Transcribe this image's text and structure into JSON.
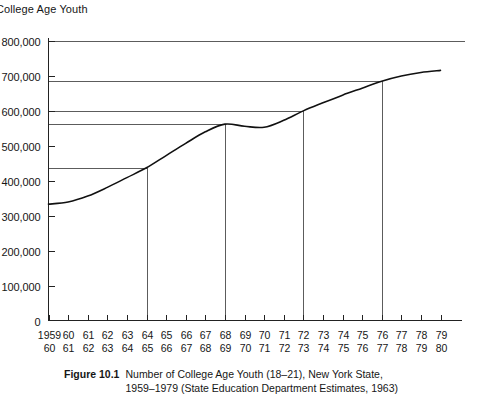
{
  "figure": {
    "axis_title": "College Age Youth",
    "caption_label": "Figure 10.1",
    "caption_line1": "Number of College Age Youth (18–21), New York State,",
    "caption_line2": "1959–1979 (State Education Department Estimates, 1963)"
  },
  "chart_data": {
    "type": "line",
    "title": "College Age Youth",
    "xlabel": "",
    "ylabel": "College Age Youth",
    "grid": false,
    "legend": "none",
    "ylim": [
      0,
      800000
    ],
    "yticks": [
      0,
      100000,
      200000,
      300000,
      400000,
      500000,
      600000,
      700000,
      800000
    ],
    "ytick_labels": [
      "0",
      "100,000",
      "200,000",
      "300,000",
      "400,000",
      "500,000",
      "600,000",
      "700,000",
      "800,000"
    ],
    "x": [
      1959,
      1960,
      1961,
      1962,
      1963,
      1964,
      1965,
      1966,
      1967,
      1968,
      1969,
      1970,
      1971,
      1972,
      1973,
      1974,
      1975,
      1976,
      1977,
      1978,
      1979
    ],
    "xtick_labels_top": [
      "1959",
      "60",
      "61",
      "62",
      "63",
      "64",
      "65",
      "66",
      "67",
      "68",
      "69",
      "70",
      "71",
      "72",
      "73",
      "74",
      "75",
      "76",
      "77",
      "78",
      "79"
    ],
    "xtick_labels_bottom": [
      "60",
      "61",
      "62",
      "63",
      "64",
      "65",
      "66",
      "67",
      "68",
      "69",
      "70",
      "71",
      "72",
      "73",
      "74",
      "75",
      "76",
      "77",
      "78",
      "79",
      "80"
    ],
    "values": [
      333000,
      339000,
      356000,
      381000,
      409000,
      437000,
      472000,
      507000,
      540000,
      562000,
      556000,
      553000,
      573000,
      600000,
      623000,
      645000,
      665000,
      685000,
      700000,
      710000,
      716000
    ],
    "annotations": [
      {
        "year": 1964,
        "value": 437000,
        "type": "drop-line-with-reference"
      },
      {
        "year": 1968,
        "value": 562000,
        "type": "drop-line-with-reference"
      },
      {
        "year": 1972,
        "value": 600000,
        "type": "drop-line-with-reference"
      },
      {
        "year": 1976,
        "value": 685000,
        "type": "drop-line-with-reference"
      }
    ],
    "reference_lines": [
      800000,
      685000,
      600000,
      562000,
      437000
    ]
  }
}
